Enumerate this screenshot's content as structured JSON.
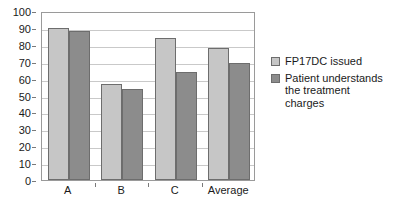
{
  "chart_data": {
    "type": "bar",
    "title": "",
    "xlabel": "",
    "ylabel": "",
    "categories": [
      "A",
      "B",
      "C",
      "Average"
    ],
    "series": [
      {
        "name": "FP17DC issued",
        "color": "#c6c6c6",
        "values": [
          90,
          57,
          84,
          78
        ]
      },
      {
        "name": "Patient understands the treatment charges",
        "color": "#8c8c8c",
        "values": [
          88,
          54,
          64,
          69
        ]
      }
    ],
    "ylim": [
      0,
      100
    ],
    "ytick_step": 10,
    "yticks": [
      0,
      10,
      20,
      30,
      40,
      50,
      60,
      70,
      80,
      90,
      100
    ],
    "ytick_labels": [
      "0",
      "10",
      "20",
      "30",
      "40",
      "50",
      "60",
      "70",
      "80",
      "90",
      "100"
    ],
    "grid": true,
    "grid_axis": "y",
    "legend_position": "right",
    "legend_entries": [
      {
        "label": "FP17DC issued",
        "lines": [
          "FP17DC issued"
        ]
      },
      {
        "label": "Patient understands the treatment charges",
        "lines": [
          "Patient understands",
          "the treatment",
          "charges"
        ]
      }
    ],
    "plot_border_color": "#9a9a9a",
    "gridline_color": "#c9c9c9",
    "bar_border_color": "#6d6d6d",
    "background_color": "#ffffff"
  }
}
